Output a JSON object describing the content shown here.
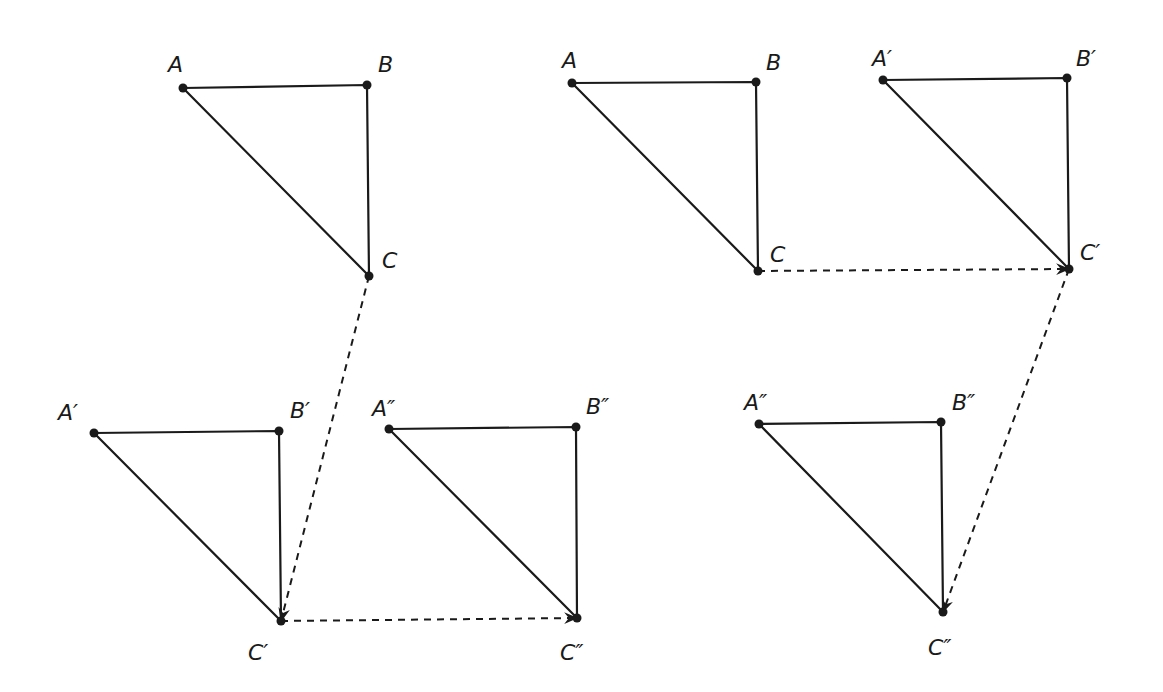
{
  "diagram": {
    "title": "",
    "colors": {
      "ink": "#1a1a1a",
      "background": "#ffffff"
    },
    "panels": [
      {
        "name": "left-panel",
        "triangles": [
          {
            "name": "ABC",
            "points": {
              "A": [
                183,
                88
              ],
              "B": [
                367,
                85
              ],
              "C": [
                369,
                276
              ]
            },
            "labels": {
              "A": "A",
              "B": "B",
              "C": "C"
            },
            "label_pos": {
              "A": [
                168,
                72
              ],
              "B": [
                378,
                72
              ],
              "C": [
                382,
                268
              ]
            }
          },
          {
            "name": "A'B'C'",
            "points": {
              "A": [
                94,
                433
              ],
              "B": [
                279,
                431
              ],
              "C": [
                281,
                621
              ]
            },
            "labels": {
              "A": "A′",
              "B": "B′",
              "C": "C′"
            },
            "label_pos": {
              "A": [
                58,
                420
              ],
              "B": [
                290,
                418
              ],
              "C": [
                248,
                660
              ]
            }
          },
          {
            "name": "A''B''C''",
            "points": {
              "A": [
                389,
                429
              ],
              "B": [
                576,
                427
              ],
              "C": [
                577,
                618
              ]
            },
            "labels": {
              "A": "A″",
              "B": "B″",
              "C": "C″"
            },
            "label_pos": {
              "A": [
                372,
                416
              ],
              "B": [
                586,
                414
              ],
              "C": [
                560,
                660
              ]
            }
          }
        ],
        "arrows": [
          {
            "name": "translation-C-to-C-prime",
            "from": [
              369,
              276
            ],
            "to": [
              281,
              621
            ]
          },
          {
            "name": "translation-C-prime-to-C-double-prime",
            "from": [
              281,
              621
            ],
            "to": [
              577,
              618
            ]
          }
        ]
      },
      {
        "name": "right-panel",
        "triangles": [
          {
            "name": "ABC",
            "points": {
              "A": [
                572,
                83
              ],
              "B": [
                756,
                82
              ],
              "C": [
                758,
                271
              ]
            },
            "labels": {
              "A": "A",
              "B": "B",
              "C": "C"
            },
            "label_pos": {
              "A": [
                562,
                68
              ],
              "B": [
                766,
                70
              ],
              "C": [
                770,
                262
              ]
            }
          },
          {
            "name": "A'B'C'",
            "points": {
              "A": [
                883,
                80
              ],
              "B": [
                1067,
                78
              ],
              "C": [
                1069,
                269
              ]
            },
            "labels": {
              "A": "A′",
              "B": "B′",
              "C": "C′"
            },
            "label_pos": {
              "A": [
                872,
                66
              ],
              "B": [
                1076,
                66
              ],
              "C": [
                1080,
                260
              ]
            }
          },
          {
            "name": "A''B''C''",
            "points": {
              "A": [
                759,
                424
              ],
              "B": [
                941,
                422
              ],
              "C": [
                943,
                612
              ]
            },
            "labels": {
              "A": "A″",
              "B": "B″",
              "C": "C″"
            },
            "label_pos": {
              "A": [
                744,
                410
              ],
              "B": [
                952,
                410
              ],
              "C": [
                928,
                655
              ]
            }
          }
        ],
        "arrows": [
          {
            "name": "translation-C-to-C-prime",
            "from": [
              758,
              271
            ],
            "to": [
              1069,
              269
            ]
          },
          {
            "name": "translation-C-prime-to-C-double-prime",
            "from": [
              1069,
              269
            ],
            "to": [
              943,
              612
            ]
          }
        ]
      }
    ]
  }
}
